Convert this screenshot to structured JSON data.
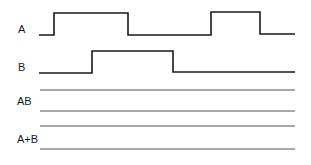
{
  "diagram": {
    "type": "timing-diagram",
    "signals": [
      {
        "id": "A",
        "label": "A",
        "points": [
          [
            39,
            35
          ],
          [
            54,
            35
          ],
          [
            54,
            13
          ],
          [
            128,
            13
          ],
          [
            128,
            35
          ],
          [
            211,
            35
          ],
          [
            211,
            12
          ],
          [
            260,
            12
          ],
          [
            260,
            34
          ],
          [
            295,
            34
          ]
        ]
      },
      {
        "id": "B",
        "label": "B",
        "points": [
          [
            39,
            73
          ],
          [
            92,
            73
          ],
          [
            92,
            51
          ],
          [
            173,
            51
          ],
          [
            173,
            72
          ],
          [
            295,
            72
          ]
        ]
      }
    ],
    "answer_rows": [
      {
        "id": "AB",
        "label": "AB",
        "lines_y": [
          90,
          111
        ]
      },
      {
        "id": "A+B",
        "label": "A+B",
        "lines_y": [
          126,
          149
        ]
      }
    ],
    "line_x_start": 40,
    "line_x_end": 295,
    "colors": {
      "waveform": "#1a1a1a",
      "answer_line": "#555555",
      "text": "#1a1a1a",
      "background": "#ffffff"
    }
  }
}
